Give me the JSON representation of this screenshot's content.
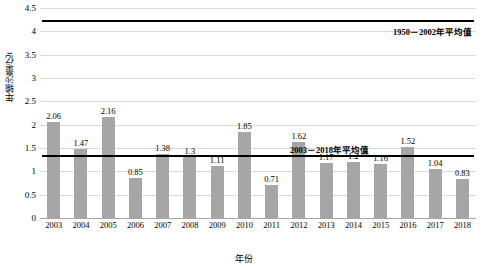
{
  "chart_data": {
    "type": "bar",
    "title": "",
    "xlabel": "年份",
    "ylabel": "年输沙量/亿t",
    "categories": [
      "2003",
      "2004",
      "2005",
      "2006",
      "2007",
      "2008",
      "2009",
      "2010",
      "2011",
      "2012",
      "2013",
      "2014",
      "2015",
      "2016",
      "2017",
      "2018"
    ],
    "values": [
      2.06,
      1.47,
      2.16,
      0.85,
      1.38,
      1.3,
      1.11,
      1.85,
      0.71,
      1.62,
      1.17,
      1.2,
      1.16,
      1.52,
      1.04,
      0.83
    ],
    "value_labels": [
      "2.06",
      "1.47",
      "2.16",
      "0.85",
      "1.38",
      "1.3",
      "1.11",
      "1.85",
      "0.71",
      "1.62",
      "1.17",
      "1.2",
      "1.16",
      "1.52",
      "1.04",
      "0.83"
    ],
    "ylim": [
      0,
      4.5
    ],
    "yticks": [
      "0",
      "0.5",
      "1",
      "1.5",
      "2",
      "2.5",
      "3",
      "3.5",
      "4",
      "4.5"
    ],
    "ytick_values": [
      0,
      0.5,
      1,
      1.5,
      2,
      2.5,
      3,
      3.5,
      4,
      4.5
    ],
    "grid": true,
    "legend": "none",
    "bar_color": "#a6a6a6",
    "line_color": "#000000",
    "annotations": [
      {
        "name": "upper-average-line",
        "label": "1950－2002年平均值",
        "value": 4.25
      },
      {
        "name": "lower-average-line",
        "label": "2003－2018年平均值",
        "value": 1.34
      }
    ]
  }
}
